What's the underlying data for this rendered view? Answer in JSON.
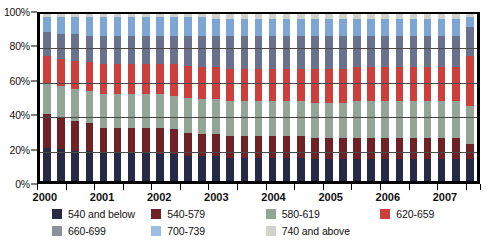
{
  "chart_data": {
    "type": "bar",
    "title": "",
    "subtitle": "",
    "xlabel": "",
    "ylabel": "",
    "stacked": true,
    "normalized": "100%",
    "grid": true,
    "legend_position": "bottom",
    "ylim": [
      0,
      100
    ],
    "yticks": [
      "0%",
      "20%",
      "40%",
      "60%",
      "80%",
      "100%"
    ],
    "ytick_values": [
      0,
      20,
      40,
      60,
      80,
      100
    ],
    "xlabels": [
      "2000",
      "2001",
      "2002",
      "2003",
      "2004",
      "2005",
      "2006",
      "2007"
    ],
    "x": [
      "2000Q1",
      "2000Q2",
      "2000Q3",
      "2000Q4",
      "2001Q1",
      "2001Q2",
      "2001Q3",
      "2001Q4",
      "2002Q1",
      "2002Q2",
      "2002Q3",
      "2002Q4",
      "2003Q1",
      "2003Q2",
      "2003Q3",
      "2003Q4",
      "2004Q1",
      "2004Q2",
      "2004Q3",
      "2004Q4",
      "2005Q1",
      "2005Q2",
      "2005Q3",
      "2005Q4",
      "2006Q1",
      "2006Q2",
      "2006Q3",
      "2006Q4",
      "2007Q1",
      "2007Q2",
      "2007Q3"
    ],
    "series": [
      {
        "name": "540 and below",
        "color": "#282a45",
        "values": [
          20,
          19,
          18,
          18,
          17,
          17,
          17,
          17,
          16,
          16,
          15,
          15,
          15,
          14,
          14,
          14,
          14,
          14,
          14,
          13,
          13,
          13,
          13,
          13,
          13,
          13,
          13,
          13,
          13,
          13,
          13
        ]
      },
      {
        "name": "540-579",
        "color": "#6e2127",
        "values": [
          20,
          19,
          18,
          17,
          15,
          15,
          15,
          15,
          16,
          15,
          14,
          13,
          13,
          13,
          13,
          13,
          13,
          13,
          13,
          13,
          13,
          13,
          13,
          13,
          13,
          13,
          13,
          13,
          13,
          13,
          9
        ]
      },
      {
        "name": "580-619",
        "color": "#93a596",
        "values": [
          19,
          19,
          19,
          19,
          20,
          20,
          20,
          20,
          20,
          20,
          21,
          21,
          21,
          21,
          21,
          21,
          21,
          21,
          21,
          21,
          21,
          21,
          22,
          22,
          22,
          22,
          22,
          22,
          22,
          22,
          23
        ]
      },
      {
        "name": "620-659",
        "color": "#cc3f3c",
        "values": [
          16,
          16,
          17,
          17,
          18,
          18,
          18,
          18,
          18,
          19,
          19,
          19,
          19,
          19,
          19,
          19,
          19,
          19,
          19,
          20,
          20,
          20,
          20,
          20,
          20,
          20,
          20,
          20,
          20,
          20,
          30
        ]
      },
      {
        "name": "660-699",
        "color": "#69718c",
        "values": [
          14,
          15,
          16,
          16,
          17,
          17,
          17,
          17,
          17,
          17,
          18,
          19,
          19,
          20,
          20,
          20,
          20,
          20,
          20,
          20,
          20,
          20,
          19,
          19,
          19,
          19,
          19,
          19,
          19,
          19,
          17
        ]
      },
      {
        "name": "700-739",
        "color": "#7ea6d4",
        "values": [
          9,
          10,
          10,
          11,
          11,
          11,
          11,
          11,
          11,
          11,
          11,
          11,
          10,
          10,
          10,
          10,
          10,
          10,
          10,
          10,
          10,
          10,
          10,
          10,
          10,
          10,
          10,
          10,
          10,
          10,
          6
        ]
      },
      {
        "name": "740 and above",
        "color": "#cfd3cc",
        "values": [
          2,
          2,
          2,
          2,
          2,
          2,
          2,
          2,
          2,
          2,
          2,
          2,
          3,
          3,
          3,
          3,
          3,
          3,
          3,
          3,
          3,
          3,
          3,
          3,
          3,
          3,
          3,
          3,
          3,
          3,
          2
        ]
      }
    ],
    "legend": [
      {
        "label": "540 and below",
        "color": "#282a45"
      },
      {
        "label": "540-579",
        "color": "#6e2127"
      },
      {
        "label": "580-619",
        "color": "#93a596"
      },
      {
        "label": "620-659",
        "color": "#cc3f3c"
      },
      {
        "label": "660-699",
        "color": "#8d9098"
      },
      {
        "label": "700-739",
        "color": "#9dbde0"
      },
      {
        "label": "740 and above",
        "color": "#cfd3cc"
      }
    ]
  }
}
